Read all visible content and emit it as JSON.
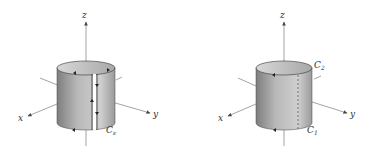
{
  "figures": [
    {
      "id": "left",
      "axes": {
        "x": "x",
        "y": "y",
        "z": "z"
      },
      "curve_label": "C",
      "curve_subscript": "ε",
      "description": "Cylinder surface cut along a vertical slit with oriented boundary curve C_ε"
    },
    {
      "id": "right",
      "axes": {
        "x": "x",
        "y": "y",
        "z": "z"
      },
      "curves": [
        {
          "label": "C",
          "subscript": "2"
        },
        {
          "label": "C",
          "subscript": "1"
        }
      ],
      "description": "Cylinder surface with top boundary C_2, bottom boundary C_1 and a dashed vertical seam"
    }
  ],
  "colors": {
    "surface_dark": "#8c8c8c",
    "surface_light": "#c8c8c8",
    "inside": "#b0b0b0",
    "axis": "#555555"
  }
}
